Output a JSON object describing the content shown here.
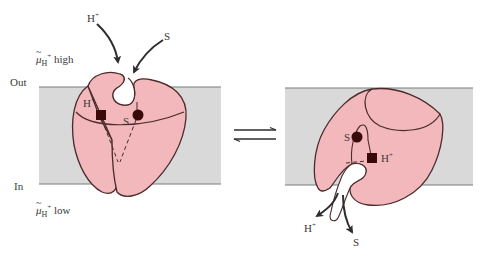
{
  "diagram": {
    "type": "proton-symport-transporter",
    "sides": {
      "out_label": "Out",
      "in_label": "In"
    },
    "gradient": {
      "high_label": {
        "symbol": "μ",
        "subscript": "H",
        "superscript": "+",
        "text": "high"
      },
      "low_label": {
        "symbol": "μ",
        "subscript": "H",
        "superscript": "+",
        "text": "low"
      }
    },
    "left_state": {
      "incoming_labels": {
        "proton": "H",
        "proton_charge": "+",
        "substrate": "S"
      },
      "site_labels": {
        "proton": "H",
        "proton_charge": "+",
        "substrate": "S"
      }
    },
    "right_state": {
      "site_labels": {
        "proton": "H",
        "proton_charge": "+",
        "substrate": "S"
      },
      "outgoing_labels": {
        "proton": "H",
        "proton_charge": "+",
        "substrate": "S"
      }
    },
    "equilibrium_symbol": "⇌",
    "colors": {
      "membrane": "#d9d9d9",
      "membrane_edge": "#7a7a7a",
      "protein": "#f2b8bc",
      "protein_outline": "#4a2a2a",
      "marker": "#3a0a0a",
      "arrow": "#2e2e2e"
    }
  }
}
